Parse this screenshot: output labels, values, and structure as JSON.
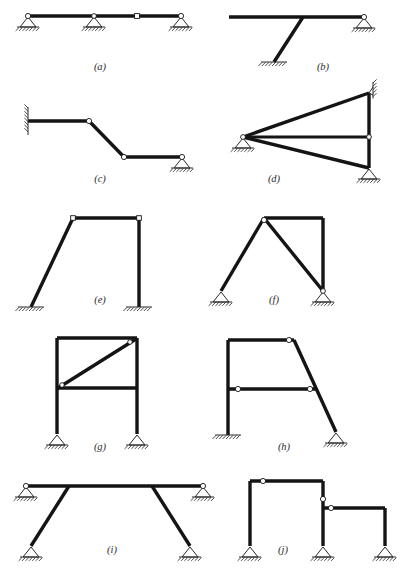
{
  "page": {
    "background_color": "#ffffff",
    "member_color": "#141414",
    "support_color": "#2a2a2a",
    "caption_color": "#2b2b2b",
    "width": 407,
    "height": 580
  },
  "captions": {
    "a": "(a)",
    "b": "(b)",
    "c": "(c)",
    "d": "(d)",
    "e": "(e)",
    "f": "(f)",
    "g": "(g)",
    "h": "(h)",
    "i": "(i)",
    "j": "(j)"
  },
  "figures": [
    {
      "id": "a",
      "label": "(a)",
      "description": "Continuous horizontal beam on three supports with one internal hinge",
      "caption_x": 100,
      "caption_y": 70,
      "members": [
        {
          "name": "beam",
          "x1": 28,
          "y1": 16,
          "x2": 181,
          "y2": 16,
          "weight": "thick"
        }
      ],
      "hinges": [
        {
          "name": "left-end-hinge",
          "x": 28,
          "y": 16,
          "shape": "circle",
          "r": 2.6
        },
        {
          "name": "mid-support-hinge",
          "x": 94,
          "y": 16,
          "shape": "circle",
          "r": 2.4
        },
        {
          "name": "internal-hinge",
          "x": 137,
          "y": 16,
          "shape": "square",
          "r": 2.4
        },
        {
          "name": "right-end-hinge",
          "x": 181,
          "y": 16,
          "shape": "circle",
          "r": 2.6
        }
      ],
      "supports": [
        {
          "name": "support-pin-left",
          "type": "pin-ground",
          "x": 28,
          "y": 16
        },
        {
          "name": "support-pin-middle",
          "type": "pin-ground",
          "x": 94,
          "y": 16
        },
        {
          "name": "support-pin-right",
          "type": "pin-ground",
          "x": 181,
          "y": 16
        }
      ]
    },
    {
      "id": "b",
      "label": "(b)",
      "description": "Horizontal beam with single inclined column fixed at base and pin support at right end",
      "caption_x": 323,
      "caption_y": 70,
      "members": [
        {
          "name": "beam",
          "x1": 229,
          "y1": 17,
          "x2": 364,
          "y2": 17,
          "weight": "thick"
        },
        {
          "name": "inclined-column",
          "x1": 303,
          "y1": 17,
          "x2": 274,
          "y2": 62,
          "weight": "thick"
        }
      ],
      "hinges": [
        {
          "name": "right-end-hinge",
          "x": 364,
          "y": 17,
          "shape": "circle",
          "r": 2.6
        }
      ],
      "supports": [
        {
          "name": "support-fixed-base",
          "type": "fixed-ground",
          "x": 274,
          "y": 62,
          "half_width": 13
        },
        {
          "name": "support-pin-right",
          "type": "pin-ground",
          "x": 364,
          "y": 17
        }
      ]
    },
    {
      "id": "c",
      "label": "(c)",
      "description": "Stepped beam fixed to a wall on the left, two internal hinges, pin support at right",
      "caption_x": 100,
      "caption_y": 182,
      "members": [
        {
          "name": "upper-horizontal",
          "x1": 28,
          "y1": 121,
          "x2": 89,
          "y2": 121,
          "weight": "thick"
        },
        {
          "name": "inclined-drop",
          "x1": 89,
          "y1": 121,
          "x2": 124,
          "y2": 157,
          "weight": "thick"
        },
        {
          "name": "lower-horizontal",
          "x1": 124,
          "y1": 157,
          "x2": 182,
          "y2": 157,
          "weight": "thick"
        }
      ],
      "hinges": [
        {
          "name": "upper-hinge",
          "x": 89,
          "y": 121,
          "shape": "circle",
          "r": 2.6
        },
        {
          "name": "lower-hinge",
          "x": 124,
          "y": 157,
          "shape": "circle",
          "r": 2.6
        },
        {
          "name": "right-end-hinge",
          "x": 182,
          "y": 157,
          "shape": "circle",
          "r": 2.6
        }
      ],
      "supports": [
        {
          "name": "support-fixed-wall",
          "type": "fixed-wall-left",
          "x": 28,
          "y": 121,
          "half_height": 14
        },
        {
          "name": "support-pin-right",
          "type": "pin-ground",
          "x": 182,
          "y": 157
        }
      ]
    },
    {
      "id": "d",
      "label": "(d)",
      "description": "Triangular frame: apex pin at left, vertical right chord between wall support and ground pin, horizontal tie member",
      "caption_x": 274,
      "caption_y": 182,
      "members": [
        {
          "name": "top-chord",
          "x1": 243,
          "y1": 137,
          "x2": 369,
          "y2": 93,
          "weight": "thick"
        },
        {
          "name": "bottom-chord",
          "x1": 243,
          "y1": 137,
          "x2": 369,
          "y2": 168,
          "weight": "thick"
        },
        {
          "name": "vertical-chord",
          "x1": 369,
          "y1": 93,
          "x2": 369,
          "y2": 168,
          "weight": "thick"
        },
        {
          "name": "horizontal-tie",
          "x1": 243,
          "y1": 137,
          "x2": 369,
          "y2": 137,
          "weight": "med"
        }
      ],
      "hinges": [
        {
          "name": "apex-hinge",
          "x": 243,
          "y": 137,
          "shape": "circle",
          "r": 2.4
        },
        {
          "name": "tie-right-hinge",
          "x": 369,
          "y": 137,
          "shape": "circle",
          "r": 2.4
        }
      ],
      "supports": [
        {
          "name": "support-pin-apex",
          "type": "pin-ground",
          "x": 243,
          "y": 137
        },
        {
          "name": "support-wall-top-right",
          "type": "fixed-wall-right-top",
          "x": 369,
          "y": 93
        },
        {
          "name": "support-pin-bottom-right",
          "type": "pin-ground",
          "x": 369,
          "y": 168
        }
      ]
    },
    {
      "id": "e",
      "label": "(e)",
      "description": "Portal frame with inclined left column and vertical right column, both fixed at base",
      "caption_x": 100,
      "caption_y": 303,
      "members": [
        {
          "name": "top-beam",
          "x1": 73,
          "y1": 218,
          "x2": 139,
          "y2": 218,
          "weight": "thick"
        },
        {
          "name": "inclined-left-column",
          "x1": 73,
          "y1": 218,
          "x2": 31,
          "y2": 307,
          "weight": "thick"
        },
        {
          "name": "right-column",
          "x1": 139,
          "y1": 218,
          "x2": 139,
          "y2": 307,
          "weight": "thick"
        }
      ],
      "hinges": [
        {
          "name": "left-joint-hinge",
          "x": 73,
          "y": 218,
          "shape": "square",
          "r": 2.3
        },
        {
          "name": "right-joint-hinge",
          "x": 139,
          "y": 218,
          "shape": "square",
          "r": 2.3
        }
      ],
      "supports": [
        {
          "name": "support-fixed-left",
          "type": "fixed-ground",
          "x": 31,
          "y": 307,
          "half_width": 13
        },
        {
          "name": "support-fixed-right",
          "type": "fixed-ground",
          "x": 139,
          "y": 307,
          "half_width": 13
        }
      ]
    },
    {
      "id": "f",
      "label": "(f)",
      "description": "A-frame with apex hinge, inclined left leg, inclined interior leg and vertical right column on pin supports",
      "caption_x": 274,
      "caption_y": 303,
      "members": [
        {
          "name": "top-beam",
          "x1": 264,
          "y1": 218,
          "x2": 323,
          "y2": 218,
          "weight": "thick"
        },
        {
          "name": "left-leg",
          "x1": 264,
          "y1": 218,
          "x2": 221,
          "y2": 291,
          "weight": "thick"
        },
        {
          "name": "interior-diagonal",
          "x1": 264,
          "y1": 218,
          "x2": 323,
          "y2": 291,
          "weight": "thick"
        },
        {
          "name": "right-column",
          "x1": 323,
          "y1": 218,
          "x2": 323,
          "y2": 291,
          "weight": "thick"
        }
      ],
      "hinges": [
        {
          "name": "apex-hinge",
          "x": 264,
          "y": 220,
          "shape": "circle",
          "r": 2.6
        },
        {
          "name": "right-base-hinge",
          "x": 323,
          "y": 291,
          "shape": "circle",
          "r": 2.4
        }
      ],
      "supports": [
        {
          "name": "support-pin-left",
          "type": "pin-ground",
          "x": 221,
          "y": 291
        },
        {
          "name": "support-pin-right",
          "type": "pin-ground",
          "x": 323,
          "y": 291
        }
      ]
    },
    {
      "id": "g",
      "label": "(g)",
      "description": "Two-level rectangular frame with a diagonal brace in the upper panel, pin supports at both bases",
      "caption_x": 100,
      "caption_y": 450,
      "members": [
        {
          "name": "top-beam",
          "x1": 57,
          "y1": 338,
          "x2": 137,
          "y2": 338,
          "weight": "thick"
        },
        {
          "name": "left-column",
          "x1": 57,
          "y1": 338,
          "x2": 57,
          "y2": 434,
          "weight": "thick"
        },
        {
          "name": "right-column",
          "x1": 137,
          "y1": 338,
          "x2": 137,
          "y2": 434,
          "weight": "thick"
        },
        {
          "name": "mid-beam",
          "x1": 57,
          "y1": 388,
          "x2": 137,
          "y2": 388,
          "weight": "thick"
        },
        {
          "name": "diagonal-brace",
          "x1": 58,
          "y1": 388,
          "x2": 136,
          "y2": 339,
          "weight": "thick"
        }
      ],
      "hinges": [
        {
          "name": "brace-lower-hinge",
          "x": 62,
          "y": 385,
          "shape": "circle",
          "r": 2.3
        },
        {
          "name": "brace-upper-hinge",
          "x": 130,
          "y": 342,
          "shape": "circle",
          "r": 2.3
        }
      ],
      "supports": [
        {
          "name": "support-pin-left",
          "type": "pin-ground",
          "x": 57,
          "y": 434
        },
        {
          "name": "support-pin-right",
          "type": "pin-ground",
          "x": 137,
          "y": 434
        }
      ]
    },
    {
      "id": "h",
      "label": "(h)",
      "description": "Frame with vertical left column fixed at base, inclined right column pinned at base, and interior beam with two hinges",
      "caption_x": 284,
      "caption_y": 450,
      "members": [
        {
          "name": "top-beam",
          "x1": 228,
          "y1": 340,
          "x2": 294,
          "y2": 340,
          "weight": "thick"
        },
        {
          "name": "left-column",
          "x1": 228,
          "y1": 340,
          "x2": 228,
          "y2": 435,
          "weight": "thick"
        },
        {
          "name": "inclined-right-column",
          "x1": 294,
          "y1": 340,
          "x2": 336,
          "y2": 432,
          "weight": "thick"
        },
        {
          "name": "mid-beam",
          "x1": 228,
          "y1": 389,
          "x2": 317,
          "y2": 389,
          "weight": "thick"
        }
      ],
      "hinges": [
        {
          "name": "top-right-hinge",
          "x": 289,
          "y": 340,
          "shape": "circle",
          "r": 2.6
        },
        {
          "name": "mid-left-hinge",
          "x": 238,
          "y": 389,
          "shape": "circle",
          "r": 2.6
        },
        {
          "name": "mid-right-hinge",
          "x": 310,
          "y": 389,
          "shape": "circle",
          "r": 2.6
        }
      ],
      "supports": [
        {
          "name": "support-fixed-left",
          "type": "fixed-ground",
          "x": 228,
          "y": 435,
          "half_width": 13
        },
        {
          "name": "support-pin-right",
          "type": "pin-ground",
          "x": 336,
          "y": 432
        }
      ]
    },
    {
      "id": "i",
      "label": "(i)",
      "description": "Horizontal beam supported at both ends with two inclined legs on pin supports",
      "caption_x": 112,
      "caption_y": 553,
      "members": [
        {
          "name": "top-beam",
          "x1": 26,
          "y1": 486,
          "x2": 203,
          "y2": 486,
          "weight": "thick"
        },
        {
          "name": "left-inclined-leg",
          "x1": 69,
          "y1": 486,
          "x2": 31,
          "y2": 546,
          "weight": "thick"
        },
        {
          "name": "right-inclined-leg",
          "x1": 152,
          "y1": 486,
          "x2": 190,
          "y2": 546,
          "weight": "thick"
        }
      ],
      "hinges": [
        {
          "name": "beam-left-hinge",
          "x": 26,
          "y": 486,
          "shape": "circle",
          "r": 2.6
        },
        {
          "name": "beam-right-hinge",
          "x": 203,
          "y": 486,
          "shape": "circle",
          "r": 2.6
        }
      ],
      "supports": [
        {
          "name": "support-pin-beam-left",
          "type": "pin-ground",
          "x": 26,
          "y": 486
        },
        {
          "name": "support-pin-beam-right",
          "type": "pin-ground",
          "x": 203,
          "y": 486
        },
        {
          "name": "support-pin-leg-left",
          "type": "pin-ground",
          "x": 31,
          "y": 546
        },
        {
          "name": "support-pin-leg-right",
          "type": "pin-ground",
          "x": 190,
          "y": 546
        }
      ]
    },
    {
      "id": "j",
      "label": "(j)",
      "description": "Stepped two-bay frame with three vertical columns on pin supports and two hinges",
      "caption_x": 283,
      "caption_y": 553,
      "members": [
        {
          "name": "upper-beam",
          "x1": 250,
          "y1": 481,
          "x2": 323,
          "y2": 481,
          "weight": "thick"
        },
        {
          "name": "left-column",
          "x1": 250,
          "y1": 481,
          "x2": 250,
          "y2": 546,
          "weight": "thick"
        },
        {
          "name": "middle-column",
          "x1": 323,
          "y1": 481,
          "x2": 323,
          "y2": 546,
          "weight": "thick"
        },
        {
          "name": "lower-beam",
          "x1": 323,
          "y1": 508,
          "x2": 385,
          "y2": 508,
          "weight": "thick"
        },
        {
          "name": "right-column",
          "x1": 385,
          "y1": 508,
          "x2": 385,
          "y2": 546,
          "weight": "thick"
        }
      ],
      "hinges": [
        {
          "name": "upper-beam-hinge",
          "x": 263,
          "y": 481,
          "shape": "circle",
          "r": 2.6
        },
        {
          "name": "middle-column-hinge",
          "x": 323,
          "y": 499,
          "shape": "circle",
          "r": 2.6
        },
        {
          "name": "lower-beam-hinge",
          "x": 331,
          "y": 508,
          "shape": "circle",
          "r": 2.6
        }
      ],
      "supports": [
        {
          "name": "support-pin-left",
          "type": "pin-ground",
          "x": 250,
          "y": 546
        },
        {
          "name": "support-pin-middle",
          "type": "pin-ground",
          "x": 323,
          "y": 546
        },
        {
          "name": "support-pin-right",
          "type": "pin-ground",
          "x": 385,
          "y": 546
        }
      ]
    }
  ]
}
